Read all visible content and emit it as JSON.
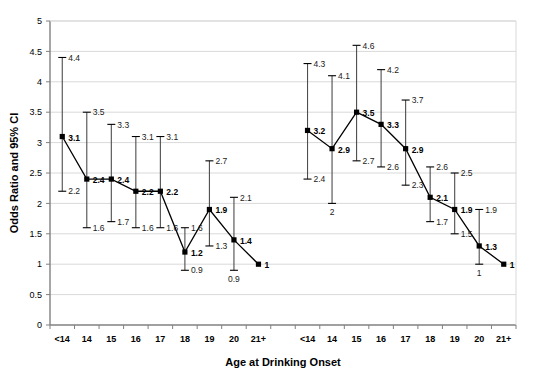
{
  "chart_data": {
    "type": "line",
    "title": "",
    "xlabel": "Age at Drinking Onset",
    "ylabel": "Odds Ratio and 95% CI",
    "ylim": [
      0,
      5
    ],
    "yticks": [
      "0",
      "0.5",
      "1",
      "1.5",
      "2",
      "2.5",
      "3",
      "3.5",
      "4",
      "4.5",
      "5"
    ],
    "ytick_values": [
      0,
      0.5,
      1,
      1.5,
      2,
      2.5,
      3,
      3.5,
      4,
      4.5,
      5
    ],
    "grid": "horizontal",
    "legend": "none",
    "categories": [
      "<14",
      "14",
      "15",
      "16",
      "17",
      "18",
      "19",
      "20",
      "21+"
    ],
    "groups": [
      {
        "name": "group-left",
        "categories": [
          "<14",
          "14",
          "15",
          "16",
          "17",
          "18",
          "19",
          "20",
          "21+"
        ],
        "values": [
          3.1,
          2.4,
          2.4,
          2.2,
          2.2,
          1.2,
          1.9,
          1.4,
          1.0
        ],
        "value_labels": [
          "3.1",
          "2.4",
          "2.4",
          "2.2",
          "2.2",
          "1.2",
          "1.9",
          "1.4",
          "1"
        ],
        "ci_upper": [
          4.4,
          3.5,
          3.3,
          3.1,
          3.1,
          1.6,
          2.7,
          2.1,
          null
        ],
        "ci_upper_labels": [
          "4.4",
          "3.5",
          "3.3",
          "3.1",
          "3.1",
          "1.6",
          "2.7",
          "2.1",
          ""
        ],
        "ci_lower": [
          2.2,
          1.6,
          1.7,
          1.6,
          1.6,
          0.9,
          1.3,
          0.9,
          null
        ],
        "ci_lower_labels": [
          "2.2",
          "1.6",
          "1.7",
          "1.6",
          "1.6",
          "0.9",
          "1.3",
          "0.9",
          ""
        ]
      },
      {
        "name": "group-right",
        "categories": [
          "<14",
          "14",
          "15",
          "16",
          "17",
          "18",
          "19",
          "20",
          "21+"
        ],
        "values": [
          3.2,
          2.9,
          3.5,
          3.3,
          2.9,
          2.1,
          1.9,
          1.3,
          1.0
        ],
        "value_labels": [
          "3.2",
          "2.9",
          "3.5",
          "3.3",
          "2.9",
          "2.1",
          "1.9",
          "1.3",
          "1"
        ],
        "ci_upper": [
          4.3,
          4.1,
          4.6,
          4.2,
          3.7,
          2.6,
          2.5,
          1.9,
          null
        ],
        "ci_upper_labels": [
          "4.3",
          "4.1",
          "4.6",
          "4.2",
          "3.7",
          "2.6",
          "2.5",
          "1.9",
          ""
        ],
        "ci_lower": [
          2.4,
          2.0,
          2.7,
          2.6,
          2.3,
          1.7,
          1.5,
          1.0,
          null
        ],
        "ci_lower_labels": [
          "2.4",
          "2",
          "2.7",
          "2.6",
          "2.3",
          "1.7",
          "1.5",
          "1",
          ""
        ]
      }
    ],
    "colors": {
      "line": "#000000",
      "marker": "#000000",
      "errorbar": "#4d4d4d",
      "grid": "#d9d9d9",
      "axis": "#808080",
      "text": "#000000"
    }
  }
}
